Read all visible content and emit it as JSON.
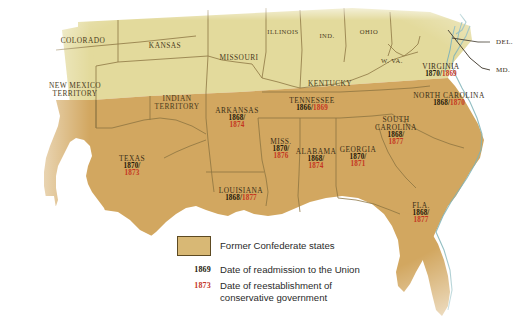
{
  "map": {
    "title": "Reconstruction: Former Confederate States",
    "colors": {
      "union_fill": "#e3da9c",
      "confederate_fill": "#d2a760",
      "border": "#8a7340",
      "coast": "#7fb3b8",
      "ocean": "#ffffff",
      "readmission_date": "#1d1709",
      "conservative_date": "#c4361f"
    },
    "union_states": [
      {
        "name": "COLORADO",
        "x": 83,
        "y": 41
      },
      {
        "name": "KANSAS",
        "x": 165,
        "y": 46
      },
      {
        "name": "MISSOURI",
        "x": 239,
        "y": 58
      },
      {
        "name": "ILLINOIS",
        "x": 283,
        "y": 32
      },
      {
        "name": "IND.",
        "x": 327,
        "y": 36
      },
      {
        "name": "OHIO",
        "x": 369,
        "y": 32
      },
      {
        "name": "NEW MEXICO TERRITORY",
        "x": 75,
        "y": 90
      },
      {
        "name": "INDIAN TERRITORY",
        "x": 177,
        "y": 103
      },
      {
        "name": "KENTUCKY",
        "x": 330,
        "y": 84
      },
      {
        "name": "W. VA.",
        "x": 392,
        "y": 61
      }
    ],
    "pointer_labels": [
      {
        "name": "DEL.",
        "x": 494,
        "y": 42
      },
      {
        "name": "MD.",
        "x": 494,
        "y": 70
      }
    ],
    "confederate_states": [
      {
        "name": "VIRGINIA",
        "readmission": "1870/",
        "conservative": "1869",
        "inline": true,
        "x": 441,
        "y": 71
      },
      {
        "name": "NORTH CAROLINA",
        "readmission": "1868/",
        "conservative": "1870",
        "inline": true,
        "x": 449,
        "y": 100
      },
      {
        "name": "TENNESSEE",
        "readmission": "1866/",
        "conservative": "1869",
        "inline": true,
        "x": 312,
        "y": 105
      },
      {
        "name": "SOUTH CAROLINA",
        "readmission": "1868/",
        "conservative": "1877",
        "inline": false,
        "x": 396,
        "y": 131,
        "twoline": true
      },
      {
        "name": "ARKANSAS",
        "readmission": "1868/",
        "conservative": "1874",
        "inline": false,
        "x": 237,
        "y": 118
      },
      {
        "name": "GEORGIA",
        "readmission": "1870/",
        "conservative": "1871",
        "inline": false,
        "x": 358,
        "y": 157
      },
      {
        "name": "MISS.",
        "readmission": "1870/",
        "conservative": "1876",
        "inline": false,
        "x": 281,
        "y": 149
      },
      {
        "name": "ALABAMA",
        "readmission": "1868/",
        "conservative": "1874",
        "inline": false,
        "x": 316,
        "y": 159
      },
      {
        "name": "TEXAS",
        "readmission": "1870/",
        "conservative": "1873",
        "inline": false,
        "x": 132,
        "y": 166
      },
      {
        "name": "LOUISIANA",
        "readmission": "1868/",
        "conservative": "1877",
        "inline": true,
        "x": 241,
        "y": 195
      },
      {
        "name": "FLA.",
        "readmission": "1868/",
        "conservative": "1877",
        "inline": false,
        "x": 421,
        "y": 213
      }
    ]
  },
  "legend": {
    "swatch_label": "Former Confederate states",
    "readmission_key": "1869",
    "readmission_label": "Date of readmission to the Union",
    "conservative_key": "1873",
    "conservative_label_line1": "Date of reestablishment of",
    "conservative_label_line2": "conservative government"
  }
}
